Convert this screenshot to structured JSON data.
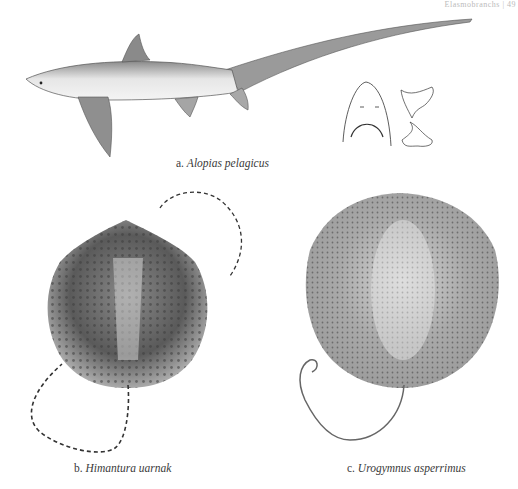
{
  "page": {
    "running_header": "Elasmobranchs | 49"
  },
  "figures": [
    {
      "letter": "a.",
      "name": "Alopias pelagicus",
      "subject": "thresher shark lateral view with head underside and teeth details"
    },
    {
      "letter": "b.",
      "name": "Himantura uarnak",
      "subject": "stingray dorsal view with long banded tail"
    },
    {
      "letter": "c.",
      "name": "Urogymnus asperrimus",
      "subject": "stingray dorsal view with spotted disc"
    }
  ]
}
